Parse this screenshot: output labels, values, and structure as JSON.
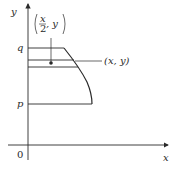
{
  "diagram": {
    "axes": {
      "x_label": "x",
      "y_label": "y",
      "origin_label": "0"
    },
    "levels": {
      "q_label": "q",
      "p_label": "p"
    },
    "annotations": {
      "midpoint_label_num": "x",
      "midpoint_label_den": "2",
      "midpoint_label_tail": ", y",
      "point_label": "(x, y)"
    },
    "colors": {
      "stroke": "#2a2a2a",
      "background": "#ffffff"
    }
  }
}
